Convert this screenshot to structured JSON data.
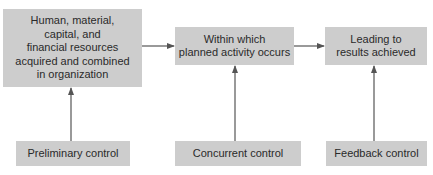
{
  "diagram": {
    "top_row": [
      {
        "id": "resources",
        "lines": [
          "Human, material,",
          "capital, and",
          "financial resources",
          "acquired and combined",
          "in organization"
        ]
      },
      {
        "id": "activity",
        "lines": [
          "Within which",
          "planned activity occurs"
        ]
      },
      {
        "id": "results",
        "lines": [
          "Leading to",
          "results achieved"
        ]
      }
    ],
    "bottom_row": [
      {
        "id": "preliminary",
        "label": "Preliminary control",
        "targets": "resources"
      },
      {
        "id": "concurrent",
        "label": "Concurrent control",
        "targets": "activity"
      },
      {
        "id": "feedback",
        "label": "Feedback control",
        "targets": "results"
      }
    ],
    "flow": [
      [
        "resources",
        "activity"
      ],
      [
        "activity",
        "results"
      ]
    ],
    "colors": {
      "box_fill": "#cdcdcd",
      "line": "#555555",
      "text": "#2a2a2a",
      "background": "#ffffff"
    }
  }
}
